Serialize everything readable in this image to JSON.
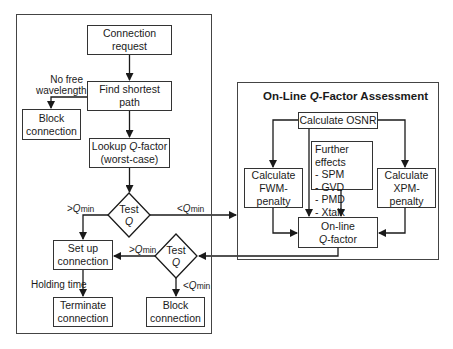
{
  "diagram": {
    "left_panel": {
      "nodes": {
        "connection_request": "Connection request",
        "find_shortest_path": "Find shortest path",
        "block_connection_top": [
          "Block",
          "connection"
        ],
        "lookup_q": {
          "prefix": "Lookup ",
          "q": "Q",
          "suffix": "-factor",
          "line2": "(worst-case)"
        },
        "test_q_1": {
          "line1": "Test",
          "line2": "Q"
        },
        "set_up_connection": [
          "Set up",
          "connection"
        ],
        "test_q_2": {
          "line1": "Test",
          "line2": "Q"
        },
        "terminate_connection": [
          "Terminate",
          "connection"
        ],
        "block_connection_bottom": [
          "Block",
          "connection"
        ]
      },
      "edge_labels": {
        "no_free_wavelength": [
          "No free",
          "wavelength"
        ],
        "gt_qmin_1": {
          "op": ">",
          "q": "Q",
          "sub": "min"
        },
        "lt_qmin_1": {
          "op": "<",
          "q": "Q",
          "sub": "min"
        },
        "gt_qmin_2": {
          "op": ">",
          "q": "Q",
          "sub": "min"
        },
        "lt_qmin_2": {
          "op": "<",
          "q": "Q",
          "sub": "min"
        },
        "holding_time": "Holding time"
      }
    },
    "right_panel": {
      "title": {
        "prefix": "On-Line ",
        "q": "Q",
        "suffix": "-Factor Assessment"
      },
      "nodes": {
        "calculate_osnr": "Calculate OSNR",
        "further_effects": {
          "heading": "Further effects",
          "items": [
            "- SPM",
            "- GVD",
            "- PMD",
            "- Xtalk"
          ]
        },
        "calc_fwm": [
          "Calculate",
          "FWM-penalty"
        ],
        "calc_xpm": [
          "Calculate",
          "XPM-penalty"
        ],
        "online_q": {
          "line1": "On-line",
          "q": "Q",
          "suffix": "-factor"
        }
      }
    },
    "colors": {
      "line": "#1a1a1a",
      "frame": "#444444",
      "background": "#ffffff"
    }
  }
}
